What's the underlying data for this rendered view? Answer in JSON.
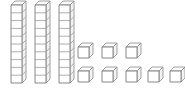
{
  "scene": {
    "title": "Base Ten Blocks",
    "description": "Three tens rods and eight unit cubes",
    "background_color": "#ffffff",
    "line_color": "#7a7a7a",
    "top_face_color": "#fbfbfb",
    "side_face_color": "#f2f2f2",
    "front_face_color": "#ffffff"
  },
  "manipulative": {
    "kind": "base-ten-blocks",
    "tens_count": 3,
    "ones_count": 8,
    "units_per_rod": 10,
    "total_value": 38
  },
  "rods": [
    {
      "label": "tens-rod-1",
      "x": 11,
      "y": 5,
      "width": 11,
      "height": 78,
      "segments": 10,
      "value": 10
    },
    {
      "label": "tens-rod-2",
      "x": 35,
      "y": 5,
      "width": 11,
      "height": 78,
      "segments": 10,
      "value": 10
    },
    {
      "label": "tens-rod-3",
      "x": 59,
      "y": 5,
      "width": 11,
      "height": 78,
      "segments": 10,
      "value": 10
    }
  ],
  "cubes_row_top": [
    {
      "label": "unit-cube-1",
      "x": 78,
      "y": 47,
      "size": 11,
      "value": 1
    },
    {
      "label": "unit-cube-2",
      "x": 102,
      "y": 47,
      "size": 11,
      "value": 1
    },
    {
      "label": "unit-cube-3",
      "x": 126,
      "y": 47,
      "size": 11,
      "value": 1
    }
  ],
  "cubes_row_bottom": [
    {
      "label": "unit-cube-4",
      "x": 78,
      "y": 71,
      "size": 11,
      "value": 1
    },
    {
      "label": "unit-cube-5",
      "x": 102,
      "y": 71,
      "size": 11,
      "value": 1
    },
    {
      "label": "unit-cube-6",
      "x": 126,
      "y": 71,
      "size": 11,
      "value": 1
    },
    {
      "label": "unit-cube-7",
      "x": 148,
      "y": 71,
      "size": 11,
      "value": 1
    },
    {
      "label": "unit-cube-8",
      "x": 170,
      "y": 71,
      "size": 11,
      "value": 1
    }
  ],
  "geometry": {
    "depth_x": 4,
    "depth_y": 4
  }
}
